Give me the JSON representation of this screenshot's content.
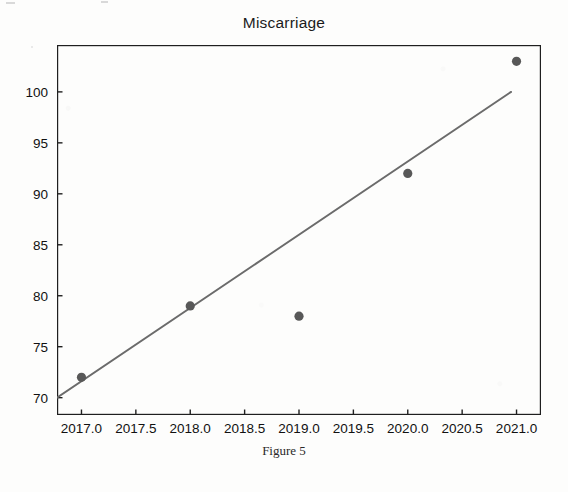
{
  "figure": {
    "title": "Miscarriage",
    "caption": "Figure 5"
  },
  "colors": {
    "marker": "#585858",
    "trendline": "#6b6b6b",
    "axis": "#1f1f1f",
    "background": "#fdfdfc",
    "text": "#111111"
  },
  "chart_data": {
    "type": "scatter",
    "title": "Miscarriage",
    "xlabel": "",
    "ylabel": "",
    "x": [
      2017,
      2018,
      2019,
      2020,
      2021
    ],
    "values": [
      72,
      79,
      78,
      92,
      103
    ],
    "series": [
      {
        "name": "Miscarriage",
        "type": "scatter",
        "x": [
          2017,
          2018,
          2019,
          2020,
          2021
        ],
        "values": [
          72,
          79,
          78,
          92,
          103
        ]
      },
      {
        "name": "Trend line",
        "type": "line",
        "x": [
          2016.775,
          2020.95
        ],
        "values": [
          70,
          100
        ]
      }
    ],
    "xlim": [
      2016.775,
      2021.225
    ],
    "ylim": [
      68.3,
      104.6
    ],
    "xticks": [
      2017.0,
      2017.5,
      2018.0,
      2018.5,
      2019.0,
      2019.5,
      2020.0,
      2020.5,
      2021.0
    ],
    "xtick_labels": [
      "2017.0",
      "2017.5",
      "2018.0",
      "2018.5",
      "2019.0",
      "2019.5",
      "2020.0",
      "2020.5",
      "2021.0"
    ],
    "yticks": [
      70,
      75,
      80,
      85,
      90,
      95,
      100
    ],
    "ytick_labels": [
      "70",
      "75",
      "80",
      "85",
      "90",
      "95",
      "100"
    ],
    "grid": false,
    "legend": "none"
  }
}
